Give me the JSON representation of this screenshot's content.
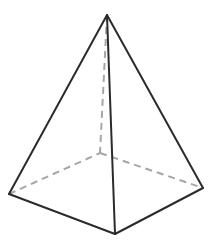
{
  "diagram": {
    "type": "square-pyramid",
    "colors": {
      "background": "#ffffff",
      "visible_edge": "#2b2b2b",
      "hidden_edge": "#a6a6a6"
    },
    "vertices": {
      "apex": [
        107,
        15
      ],
      "base_left": [
        9,
        194
      ],
      "base_front": [
        115,
        234
      ],
      "base_right": [
        203,
        188
      ],
      "base_back": [
        100,
        153
      ]
    },
    "visible_edges": [
      [
        "apex",
        "base_left"
      ],
      [
        "apex",
        "base_front"
      ],
      [
        "apex",
        "base_right"
      ],
      [
        "base_left",
        "base_front"
      ],
      [
        "base_front",
        "base_right"
      ]
    ],
    "hidden_edges": [
      [
        "apex",
        "base_back"
      ],
      [
        "base_left",
        "base_back"
      ],
      [
        "base_back",
        "base_right"
      ]
    ]
  }
}
